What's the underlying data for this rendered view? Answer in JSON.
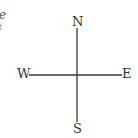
{
  "fragment": {
    "line1": "e",
    "line2": "t"
  },
  "compass": {
    "north": "N",
    "south": "S",
    "west": "W",
    "east": "E"
  },
  "colors": {
    "axis": "#3a3a3a",
    "background": "#ffffff"
  }
}
